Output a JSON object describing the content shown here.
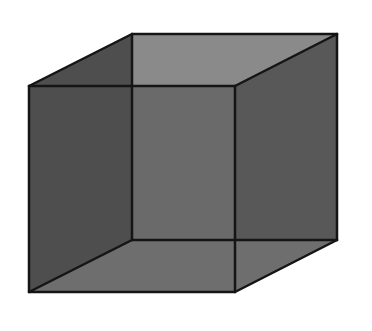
{
  "diagram": {
    "type": "necker-cube",
    "vertices": {
      "front_top_left": [
        29,
        86
      ],
      "front_top_right": [
        235,
        86
      ],
      "front_bottom_left": [
        29,
        292
      ],
      "front_bottom_right": [
        235,
        292
      ],
      "back_top_left": [
        132,
        34
      ],
      "back_top_right": [
        337,
        34
      ],
      "back_bottom_left": [
        132,
        240
      ],
      "back_bottom_right": [
        337,
        240
      ]
    },
    "colors": {
      "background": "#ffffff",
      "edge": "#151515",
      "left_face": "#4e4e4e",
      "back_face": "#6a6a6a",
      "top_face": "#8a8a8a",
      "right_face": "#585858",
      "bottom_face": "#6e6e6e"
    },
    "edge_width": 2.5
  }
}
